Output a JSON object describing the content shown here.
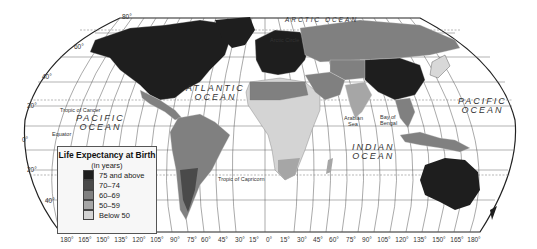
{
  "map": {
    "legend": {
      "title": "Life Expectancy at Birth",
      "subtitle": "(in years)",
      "classes": [
        {
          "label": "75 and above",
          "color": "#1e1e1e"
        },
        {
          "label": "70–74",
          "color": "#4a4a4a"
        },
        {
          "label": "60–69",
          "color": "#808080"
        },
        {
          "label": "50–59",
          "color": "#a6a6a6"
        },
        {
          "label": "Below 50",
          "color": "#d4d4d4"
        }
      ]
    },
    "oceans": {
      "atlantic_1": "ATLANTIC",
      "atlantic_2": "OCEAN",
      "pacific_w_1": "PACIFIC",
      "pacific_w_2": "OCEAN",
      "pacific_e_1": "PACIFIC",
      "pacific_e_2": "OCEAN",
      "indian_1": "INDIAN",
      "indian_2": "OCEAN",
      "arctic": "ARCTIC OCEAN"
    },
    "features": {
      "arctic_circle": "Arctic Circle",
      "tropic_cancer": "Tropic of Cancer",
      "equator": "Equator",
      "tropic_capricorn": "Tropic of Capricorn",
      "arabian_sea_1": "Arabian",
      "arabian_sea_2": "Sea",
      "bay_bengal_1": "Bay of",
      "bay_bengal_2": "Bengal"
    },
    "latitudes": {
      "l80": "80°",
      "l60": "60°",
      "l40n": "40°",
      "l20n": "20°",
      "l0": "0°",
      "l20s": "20°",
      "l40s": "40°"
    },
    "longitudes": [
      "180°",
      "165°",
      "150°",
      "135°",
      "120°",
      "105°",
      "90°",
      "75°",
      "60°",
      "45°",
      "30°",
      "15°",
      "0°",
      "15°",
      "30°",
      "45°",
      "60°",
      "75°",
      "90°",
      "105°",
      "120°",
      "135°",
      "150°",
      "165°",
      "180°"
    ]
  }
}
